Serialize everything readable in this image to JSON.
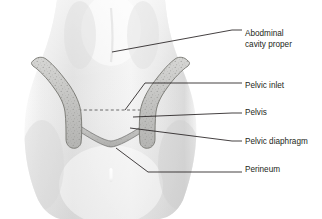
{
  "figure": {
    "background_color": "#ffffff",
    "body_fill_light": "#f2f2f2",
    "body_fill_mid": "#e3e3e3",
    "body_fill_shadow": "#d2d2d2",
    "bone_fill": "#c9c9c7",
    "bone_outline": "#7a7a78",
    "diaphragm_fill": "#bfbfbd",
    "line_color": "#231f20",
    "text_color": "#231f20"
  },
  "labels": [
    {
      "id": "abdominal-cavity-proper",
      "lines": [
        "Abodminal",
        "cavity proper"
      ],
      "line1": "Abodminal",
      "line2": "cavity proper",
      "text_x": 245,
      "text_y1": 34,
      "text_y2": 45,
      "leader_points": "112,52 232,30 242,30"
    },
    {
      "id": "pelvic-inlet",
      "lines": [
        "Pelvic inlet"
      ],
      "line1": "Pelvic inlet",
      "text_x": 245,
      "text_y1": 86,
      "leader_points": "125,110 145,83 232,83 242,83"
    },
    {
      "id": "pelvis",
      "lines": [
        "Pelvis"
      ],
      "line1": "Pelvis",
      "text_x": 245,
      "text_y1": 113,
      "leader_points": "133,117 232,113 242,113"
    },
    {
      "id": "pelvic-diaphragm",
      "lines": [
        "Pelvic diaphragm"
      ],
      "line1": "Pelvic diaphragm",
      "text_x": 245,
      "text_y1": 142,
      "leader_points": "130,128 232,141 242,141"
    },
    {
      "id": "perineum",
      "lines": [
        "Perineum"
      ],
      "line1": "Perineum",
      "text_x": 245,
      "text_y1": 170,
      "leader_points": "116,148 148,172 232,172 242,172"
    }
  ],
  "anatomy": {
    "torso": {
      "name": "torso-silhouette",
      "path": "M 57,0 L 165,0 C 167,22 171,40 178,58 C 186,78 194,96 196,120 C 198,146 192,176 183,200 C 177,212 170,217 160,219 L 60,219 C 49,216 41,208 36,195 C 27,172 23,146 25,120 C 27,96 34,78 42,58 C 49,40 54,22 57,0 Z"
    },
    "hip_bone_left": {
      "name": "hip-bone-left",
      "description": "Left hip bone: iliac crest curving from upper left down to the pubic region",
      "path": "M 33,61 C 36,57 42,56 46,59 C 54,65 62,75 70,86 C 76,95 80,104 81,113 C 82,124 82,134 81,143 C 80,147 76,149 72,148 C 68,147 66,143 66,139 C 66,130 66,120 65,112 C 64,104 60,96 54,88 C 47,78 39,70 33,66 C 31,64 31,62 33,61 Z"
    },
    "hip_bone_right": {
      "name": "hip-bone-right",
      "description": "Right hip bone: iliac crest curving from upper right down to the pubic region",
      "path": "M 188,61 C 185,57 179,56 175,59 C 167,65 159,75 151,86 C 145,95 141,104 140,113 C 139,124 139,134 140,143 C 141,147 145,149 149,148 C 153,147 155,143 155,139 C 155,130 155,120 156,112 C 157,104 161,96 167,88 C 174,78 182,70 188,66 C 190,64 190,62 188,61 Z"
    },
    "pelvic_diaphragm": {
      "name": "pelvic-diaphragm-band",
      "description": "Curved band sagging between the two hip bones forming the pelvic floor",
      "path": "M 73,121 C 90,133 105,141 111,141 C 117,141 133,133 149,121 L 149,127 C 133,139 117,147 111,147 C 105,147 90,139 73,127 Z"
    },
    "pelvic_inlet_dashed": {
      "name": "pelvic-inlet-dashed-line",
      "description": "Dashed horizontal line spanning the pelvic brim",
      "x1": 73,
      "y1": 110,
      "x2": 149,
      "y2": 110
    },
    "navel_cleft": {
      "name": "navel-cleft-marking",
      "description": "Small light vertical marking at the lower midline",
      "x": 111,
      "y": 168,
      "width": 3,
      "height": 14
    }
  }
}
